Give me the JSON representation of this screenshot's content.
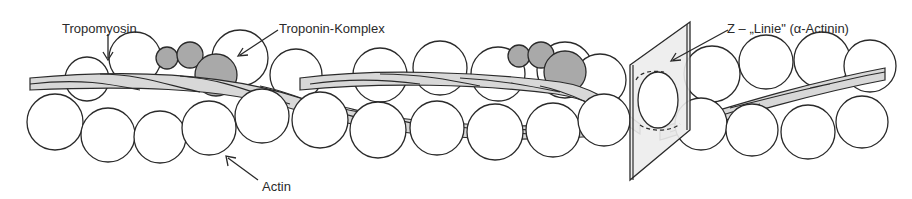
{
  "diagram": {
    "labels": {
      "tropomyosin": "Tropomyosin",
      "troponin": "Troponin-Komplex",
      "zline": "Z – „Linie\" (α-Actinin)",
      "actin": "Actin"
    },
    "colors": {
      "stroke": "#2a2a2a",
      "actin_fill": "#ffffff",
      "troponin_fill": "#a9a9a9",
      "tropomyosin_fill": "#d8d8d8",
      "zdisc_fill": "#ececec",
      "background": "#ffffff"
    },
    "components": [
      {
        "name": "Actin",
        "shape": "chain of white spheres (double helix)"
      },
      {
        "name": "Tropomyosin",
        "shape": "twisted grey double strand"
      },
      {
        "name": "Troponin-Komplex",
        "shape": "cluster of three grey spheres",
        "count": 2
      },
      {
        "name": "Z-Linie (α-Actinin)",
        "shape": "grey plane crossing the filament"
      }
    ]
  }
}
